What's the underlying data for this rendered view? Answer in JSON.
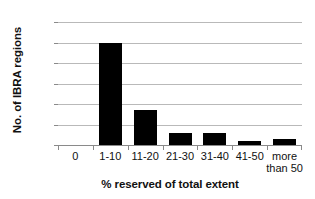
{
  "chart_data": {
    "type": "bar",
    "title": "",
    "xlabel": "% reserved of total extent",
    "ylabel": "No. of IBRA regions",
    "categories": [
      "0",
      "1-10",
      "11-20",
      "21-30",
      "31-40",
      "41-50",
      "more\nthan 50"
    ],
    "values": [
      0,
      50,
      17,
      6,
      6,
      2,
      3
    ],
    "ylim": [
      0,
      60
    ],
    "yticks": [
      0,
      10,
      20,
      30,
      40,
      50,
      60
    ],
    "ytick_labels": [
      "0",
      "10",
      "20",
      "30",
      "40",
      "50",
      "60"
    ],
    "grid": "horizontal",
    "legend": "none",
    "bar_color": "#000000",
    "gridline_color": "#b9b9b9",
    "axis_color": "#8a8a8a",
    "background_color": "#ffffff"
  }
}
